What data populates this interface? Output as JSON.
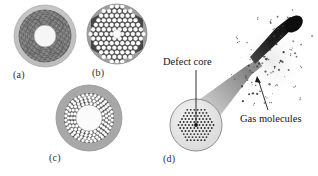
{
  "figure": {
    "background_color": "#ffffff",
    "width": 318,
    "height": 176
  },
  "panels": [
    {
      "id": "a",
      "label": "(a)",
      "name": "panel-a-ring-structured-fiber",
      "description": "Concentric ring photonic crystal fiber cross-section",
      "center": {
        "x": 45,
        "y": 36
      },
      "outer_radius": 31,
      "colors": {
        "cladding": "#c9c9c9",
        "ring_region": "#6e6e6e",
        "core": "#f4f4f4",
        "texture": "#8d8d8d"
      },
      "core_radius": 11,
      "ring_inner_radius": 12,
      "ring_outer_radius": 26
    },
    {
      "id": "b",
      "label": "(b)",
      "name": "panel-b-hexagonal-lattice-fiber",
      "description": "Hexagonal lattice of air holes with small central defect core",
      "center": {
        "x": 117,
        "y": 34
      },
      "outer_radius": 30,
      "colors": {
        "cladding": "#9a9a9a",
        "lattice": "#4a4a4a",
        "hole": "#ffffff",
        "core": "#ffffff"
      },
      "hole_radius": 2.1,
      "lattice_pitch": 5.3,
      "core_radius": 4
    },
    {
      "id": "c",
      "label": "(c)",
      "name": "panel-c-hollow-core-annular-fiber",
      "description": "Hollow core fiber with annular band of air holes",
      "center": {
        "x": 89,
        "y": 118
      },
      "outer_radius": 33,
      "colors": {
        "cladding": "#a5a5a5",
        "ring_region": "#4f4f4f",
        "hole": "#ffffff",
        "core": "#fbfbfb"
      },
      "core_radius": 13,
      "ring_inner_radius": 13,
      "ring_outer_radius": 25,
      "hole_radius": 1.6
    },
    {
      "id": "d",
      "label": "(d)",
      "name": "panel-d-tapered-gas-filled-fiber",
      "description": "Tapered photonic crystal fiber emitting gas molecules, with circular end-face inset",
      "inset_center": {
        "x": 196,
        "y": 125
      },
      "inset_radius": 26,
      "colors": {
        "fiber_body": "#c4c4c4",
        "fiber_tip": "#1a1a1a",
        "inset_face": "#e9e9e9",
        "inset_hole": "#2d2d2d",
        "molecule": "#3a3a3a",
        "leader_line": "#1a1a1a"
      }
    }
  ],
  "callouts": [
    {
      "id": "defect-core",
      "text": "Defect core",
      "name": "defect-core-label",
      "leader_from": {
        "x": 196,
        "y": 70
      },
      "leader_to": {
        "x": 196,
        "y": 120
      }
    },
    {
      "id": "gas-molecules",
      "text": "Gas molecules",
      "name": "gas-molecules-label",
      "leader_from": {
        "x": 268,
        "y": 112
      },
      "leader_to": {
        "x": 258,
        "y": 78
      }
    }
  ]
}
